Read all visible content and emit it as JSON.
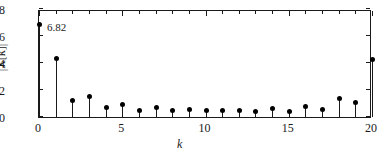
{
  "chart_data": {
    "type": "bar",
    "subtype": "stem",
    "title": "",
    "xlabel": "k",
    "ylabel": "|X[k]|",
    "xlim": [
      0,
      20
    ],
    "ylim": [
      0,
      8
    ],
    "grid": false,
    "legend": null,
    "x": [
      0,
      1,
      2,
      3,
      4,
      5,
      6,
      7,
      8,
      9,
      10,
      11,
      12,
      13,
      14,
      15,
      16,
      17,
      18,
      19,
      20
    ],
    "values": [
      6.82,
      4.35,
      1.25,
      1.55,
      0.67,
      0.92,
      0.5,
      0.67,
      0.47,
      0.53,
      0.45,
      0.45,
      0.48,
      0.38,
      0.6,
      0.42,
      0.8,
      0.55,
      1.37,
      1.1,
      4.25
    ],
    "xticks": [
      0,
      5,
      10,
      15,
      20
    ],
    "xtick_labels": [
      "0",
      "5",
      "10",
      "15",
      "20"
    ],
    "xtick_minor_step": 1,
    "yticks": [
      0,
      2,
      4,
      6,
      8
    ],
    "ytick_labels": [
      "0",
      "2",
      "4",
      "6",
      "8"
    ],
    "annotations": [
      {
        "text": "6.82",
        "x": 0,
        "y": 6.82
      }
    ],
    "colors": {
      "stem": "#1a1a1a",
      "marker": "#000000",
      "axis": "#1a1a1a",
      "background": "#ffffff"
    }
  }
}
